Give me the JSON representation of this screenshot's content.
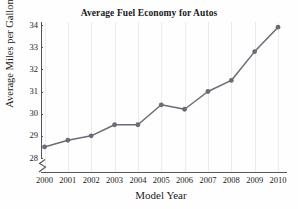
{
  "chart_data": {
    "type": "line",
    "title": "Average Fuel Economy for Autos",
    "xlabel": "Model Year",
    "ylabel": "Average Miles per Gallon",
    "categories": [
      "2000",
      "2001",
      "2002",
      "2003",
      "2004",
      "2005",
      "2006",
      "2007",
      "2008",
      "2009",
      "2010"
    ],
    "values": [
      28.5,
      28.8,
      29.0,
      29.5,
      29.5,
      30.4,
      30.2,
      31.0,
      31.5,
      32.8,
      33.9
    ],
    "x": [
      2000,
      2001,
      2002,
      2003,
      2004,
      2005,
      2006,
      2007,
      2008,
      2009,
      2010
    ],
    "ylim": [
      28,
      34
    ],
    "xlim": [
      2000,
      2010
    ],
    "yticks": [
      28,
      29,
      30,
      31,
      32,
      33,
      34
    ],
    "ytick_labels": [
      "28",
      "29",
      "30",
      "31",
      "32",
      "33",
      "34"
    ],
    "xtick_labels": [
      "2000",
      "2001",
      "2002",
      "2003",
      "2004",
      "2005",
      "2006",
      "2007",
      "2008",
      "2009",
      "2010"
    ],
    "grid": "vertical-faint",
    "legend": null,
    "axis_break": "y-axis broken below 28",
    "series_color": "#6b6b76",
    "marker": "circle",
    "series": [
      {
        "name": "Average Miles per Gallon",
        "values": [
          28.5,
          28.8,
          29.0,
          29.5,
          29.5,
          30.4,
          30.2,
          31.0,
          31.5,
          32.8,
          33.9
        ]
      }
    ]
  },
  "icons": {
    "axis_break": "axis-break-zigzag-icon"
  }
}
